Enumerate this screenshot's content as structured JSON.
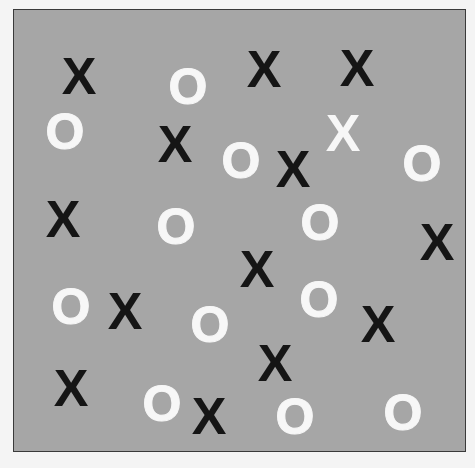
{
  "stimulus": {
    "background_color": "#a6a6a6",
    "border_color": "#3a3a3a",
    "colors": {
      "black": "#151515",
      "white": "#f7f7f7"
    },
    "items": [
      {
        "char": "X",
        "color": "black",
        "x": 78,
        "y": 75
      },
      {
        "char": "O",
        "color": "white",
        "x": 187,
        "y": 86
      },
      {
        "char": "X",
        "color": "black",
        "x": 263,
        "y": 68
      },
      {
        "char": "X",
        "color": "black",
        "x": 356,
        "y": 67
      },
      {
        "char": "O",
        "color": "white",
        "x": 64,
        "y": 131
      },
      {
        "char": "X",
        "color": "black",
        "x": 174,
        "y": 143
      },
      {
        "char": "X",
        "color": "white",
        "x": 342,
        "y": 132
      },
      {
        "char": "O",
        "color": "white",
        "x": 240,
        "y": 160
      },
      {
        "char": "X",
        "color": "black",
        "x": 292,
        "y": 168
      },
      {
        "char": "O",
        "color": "white",
        "x": 421,
        "y": 163
      },
      {
        "char": "X",
        "color": "black",
        "x": 62,
        "y": 218
      },
      {
        "char": "O",
        "color": "white",
        "x": 175,
        "y": 226
      },
      {
        "char": "O",
        "color": "white",
        "x": 319,
        "y": 222
      },
      {
        "char": "X",
        "color": "black",
        "x": 436,
        "y": 241
      },
      {
        "char": "X",
        "color": "black",
        "x": 256,
        "y": 268
      },
      {
        "char": "O",
        "color": "white",
        "x": 70,
        "y": 306
      },
      {
        "char": "X",
        "color": "black",
        "x": 124,
        "y": 310
      },
      {
        "char": "O",
        "color": "white",
        "x": 318,
        "y": 299
      },
      {
        "char": "O",
        "color": "white",
        "x": 209,
        "y": 324
      },
      {
        "char": "X",
        "color": "black",
        "x": 377,
        "y": 323
      },
      {
        "char": "X",
        "color": "black",
        "x": 274,
        "y": 362
      },
      {
        "char": "X",
        "color": "black",
        "x": 70,
        "y": 387
      },
      {
        "char": "O",
        "color": "white",
        "x": 161,
        "y": 403
      },
      {
        "char": "X",
        "color": "black",
        "x": 208,
        "y": 415
      },
      {
        "char": "O",
        "color": "white",
        "x": 294,
        "y": 416
      },
      {
        "char": "O",
        "color": "white",
        "x": 402,
        "y": 412
      }
    ]
  }
}
